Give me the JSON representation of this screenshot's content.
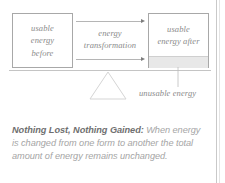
{
  "diagram": {
    "box_before": {
      "label": "usable\nenergy\nbefore",
      "name": "usable-energy-before-box"
    },
    "box_after": {
      "label": "usable\nenergy after",
      "name": "usable-energy-after-box"
    },
    "transformation": {
      "label": "energy\ntransformation"
    },
    "unusable": {
      "label": "unusable energy"
    },
    "colors": {
      "box_border": "#a8a8a8",
      "text": "#8b8b8b",
      "arrow": "#b5b5b5",
      "arrow_head": "#7d7d7d",
      "band_fill": "#e8e8e8",
      "beam": "#c4c4c4",
      "fulcrum": "#d5d5d5",
      "page_rule": "#c9c9c9"
    }
  },
  "caption": {
    "lead": "Nothing Lost, Nothing Gained:",
    "body": " When energy is changed from one form to another the total amount of energy remains unchanged."
  }
}
